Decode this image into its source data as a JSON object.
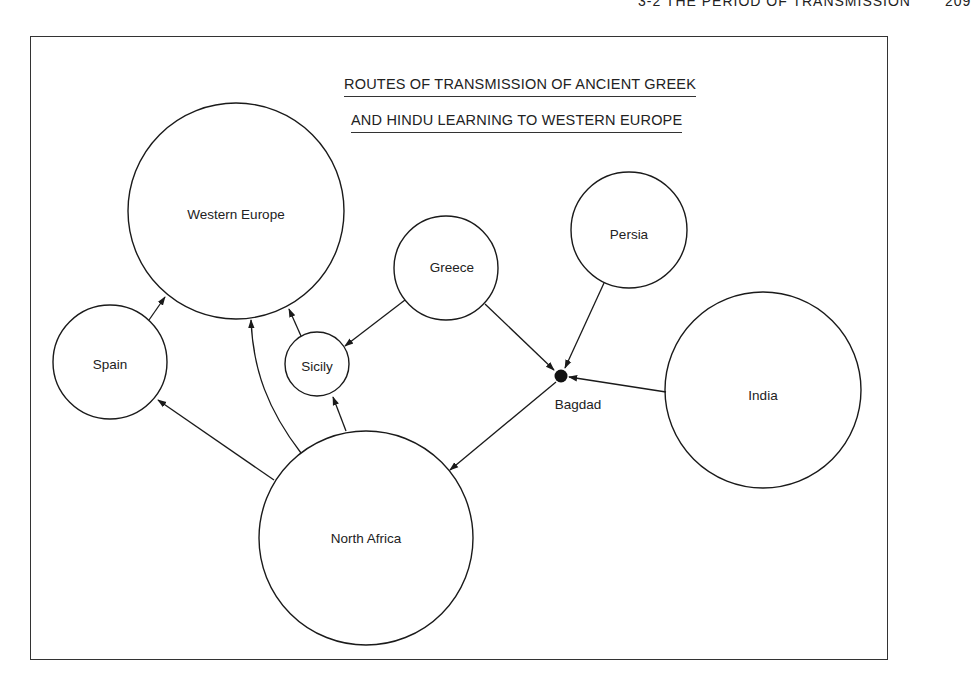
{
  "running_head": {
    "section": "3-2 THE PERIOD OF TRANSMISSION",
    "page_number": "209"
  },
  "figure": {
    "title_line_1": "ROUTES OF TRANSMISSION OF ANCIENT GREEK",
    "title_line_2": "AND HINDU LEARNING TO WESTERN EUROPE"
  },
  "nodes": {
    "western_europe": {
      "label": "Western Europe",
      "cx": 236,
      "cy": 211,
      "r": 108
    },
    "spain": {
      "label": "Spain",
      "cx": 110,
      "cy": 362,
      "r": 57
    },
    "sicily": {
      "label": "Sicily",
      "cx": 317,
      "cy": 364,
      "r": 32
    },
    "greece": {
      "label": "Greece",
      "cx": 446,
      "cy": 268,
      "r": 52
    },
    "persia": {
      "label": "Persia",
      "cx": 629,
      "cy": 230,
      "r": 58
    },
    "india": {
      "label": "India",
      "cx": 763,
      "cy": 390,
      "r": 98
    },
    "north_africa": {
      "label": "North Africa",
      "cx": 366,
      "cy": 538,
      "r": 107
    },
    "bagdad": {
      "label": "Bagdad",
      "cx": 561,
      "cy": 376,
      "r": 6
    }
  },
  "edges": [
    {
      "from": "Spain",
      "to": "Western Europe"
    },
    {
      "from": "Sicily",
      "to": "Western Europe"
    },
    {
      "from": "North Africa",
      "to": "Western Europe"
    },
    {
      "from": "North Africa",
      "to": "Spain"
    },
    {
      "from": "North Africa",
      "to": "Sicily"
    },
    {
      "from": "Greece",
      "to": "Sicily"
    },
    {
      "from": "Greece",
      "to": "Bagdad"
    },
    {
      "from": "Persia",
      "to": "Bagdad"
    },
    {
      "from": "India",
      "to": "Bagdad"
    },
    {
      "from": "Bagdad",
      "to": "North Africa"
    }
  ],
  "colors": {
    "ink": "#1a1a1a",
    "paper": "#ffffff"
  }
}
